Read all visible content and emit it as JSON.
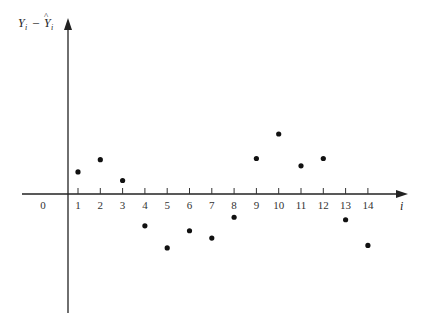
{
  "chart_data": {
    "type": "scatter",
    "title": "",
    "xlabel": "i",
    "ylabel": "Y_i - Ŷ_i",
    "origin_label": "0",
    "x_ticks": [
      1,
      2,
      3,
      4,
      5,
      6,
      7,
      8,
      9,
      10,
      11,
      12,
      13,
      14
    ],
    "x": [
      1,
      2,
      3,
      4,
      5,
      6,
      7,
      8,
      9,
      10,
      11,
      12,
      13,
      14
    ],
    "y": [
      0.9,
      1.4,
      0.55,
      -1.3,
      -2.2,
      -1.5,
      -1.8,
      -0.95,
      1.45,
      2.45,
      1.15,
      1.45,
      -1.05,
      -2.1
    ],
    "ylim": [
      -5,
      6.5
    ],
    "xlim": [
      0,
      15
    ],
    "grid": false,
    "legend": null,
    "y_tick_labels": false,
    "marker_color": "#111111"
  },
  "labels": {
    "y_axis_text": "Y",
    "y_axis_sub": "i",
    "minus": "–",
    "yhat_text": "Y",
    "yhat_sub": "i",
    "hat": "^",
    "x_axis_text": "i",
    "origin": "0"
  }
}
